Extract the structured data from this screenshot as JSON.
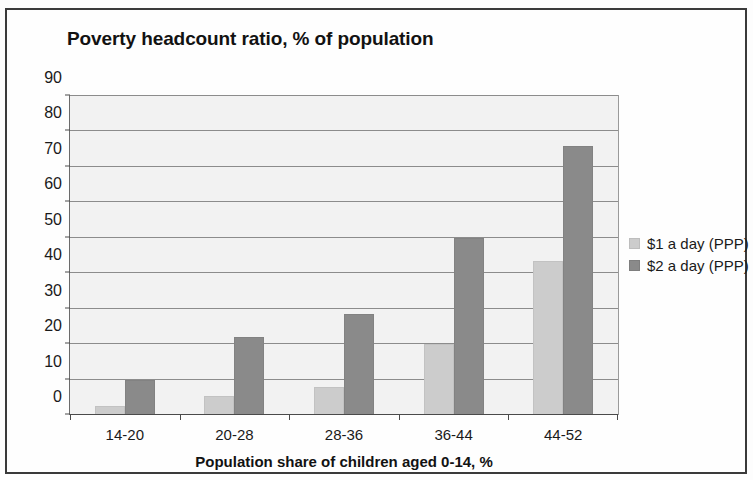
{
  "chart_data": {
    "type": "bar",
    "title": "Poverty headcount ratio, % of population",
    "xlabel": "Population share of children aged 0-14, %",
    "ylabel": "",
    "categories": [
      "14-20",
      "20-28",
      "28-36",
      "36-44",
      "44-52"
    ],
    "series": [
      {
        "name": "$1 a day (PPP)",
        "color": "#cccccc",
        "values": [
          2.5,
          5.5,
          8,
          20,
          43.5
        ]
      },
      {
        "name": "$2 a day (PPP)",
        "color": "#8a8a8a",
        "values": [
          10,
          22,
          28.5,
          50,
          76
        ]
      }
    ],
    "ylim": [
      0,
      90
    ],
    "yticks": [
      0,
      10,
      20,
      30,
      40,
      50,
      60,
      70,
      80,
      90
    ],
    "ytick_labels": [
      "0",
      "10",
      "20",
      "30",
      "40",
      "50",
      "60",
      "70",
      "80",
      "90"
    ],
    "grid": true,
    "legend_position": "right",
    "plot_background": "#f2f2f2",
    "frame_color": "#3a3a3a"
  },
  "legend": {
    "entries": [
      {
        "label": "$1 a day (PPP)"
      },
      {
        "label": "$2 a day (PPP)"
      }
    ]
  }
}
